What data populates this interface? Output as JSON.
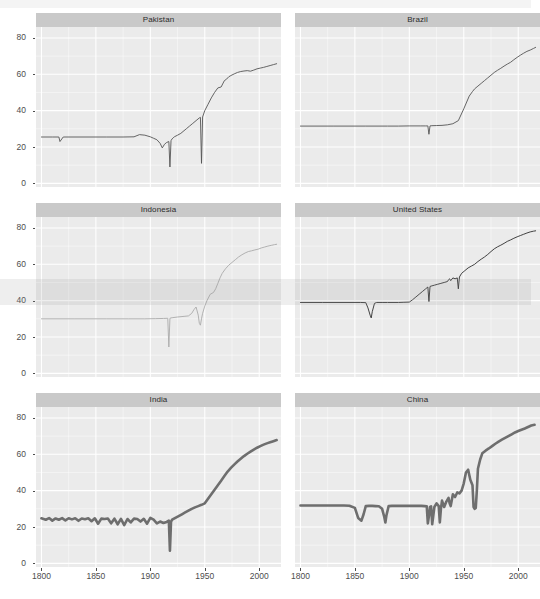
{
  "figure": {
    "kind": "small-multiples-line-chart",
    "background": "#ffffff",
    "panel_background": "#ebebeb",
    "gridline_color": "#ffffff",
    "strip_background": "#c9c9c9",
    "axis_text_color": "#4d4d4d"
  },
  "axes": {
    "y_ticks": [
      "0",
      "20",
      "40",
      "60",
      "80"
    ],
    "y_values": [
      0,
      20,
      40,
      60,
      80
    ],
    "x_ticks": [
      "1800",
      "1850",
      "1900",
      "1950",
      "2000"
    ],
    "x_values": [
      1800,
      1850,
      1900,
      1950,
      2000
    ],
    "xlim": [
      1795,
      2020
    ],
    "ylim": [
      -2,
      86
    ],
    "xlabel": "",
    "ylabel": "",
    "grid": true
  },
  "chart_data": {
    "type": "line",
    "title": "",
    "subtitle": "",
    "xlabel": "",
    "ylabel": "",
    "xlim": [
      1795,
      2020
    ],
    "ylim": [
      -2,
      86
    ],
    "grid": true,
    "legend": "none",
    "facet_layout": {
      "rows": 3,
      "cols": 2
    },
    "panels": [
      {
        "label": "Pakistan",
        "row": 0,
        "col": 0,
        "color": "#555555",
        "line_width": 0.9,
        "x": [
          1800,
          1810,
          1816,
          1817,
          1820,
          1840,
          1860,
          1875,
          1885,
          1890,
          1895,
          1900,
          1903,
          1906,
          1909,
          1911,
          1913,
          1915,
          1917,
          1918,
          1919,
          1920,
          1921,
          1922,
          1925,
          1928,
          1930,
          1933,
          1936,
          1939,
          1942,
          1945,
          1946,
          1947,
          1948,
          1950,
          1953,
          1956,
          1959,
          1962,
          1965,
          1968,
          1970,
          1971,
          1972,
          1974,
          1977,
          1980,
          1983,
          1986,
          1989,
          1992,
          1995,
          1998,
          2001,
          2004,
          2007,
          2010,
          2013,
          2016
        ],
        "y": [
          25.5,
          25.5,
          25.5,
          23.0,
          25.5,
          25.5,
          25.5,
          25.5,
          25.6,
          26.8,
          26.5,
          25.6,
          24.8,
          24.0,
          22.0,
          19.5,
          21.5,
          22.5,
          23.0,
          9.0,
          23.5,
          24.5,
          25.0,
          25.6,
          26.5,
          27.5,
          28.5,
          30.0,
          31.5,
          33.0,
          34.5,
          36.0,
          36.3,
          11.0,
          36.5,
          40.0,
          43.5,
          47.0,
          50.0,
          52.5,
          53.0,
          56.5,
          57.3,
          58.0,
          58.6,
          59.3,
          60.2,
          61.0,
          61.5,
          61.8,
          62.0,
          61.7,
          62.3,
          63.0,
          63.4,
          63.8,
          64.3,
          64.8,
          65.3,
          65.8
        ]
      },
      {
        "label": "Brazil",
        "row": 0,
        "col": 1,
        "color": "#555555",
        "line_width": 0.9,
        "x": [
          1800,
          1830,
          1860,
          1880,
          1890,
          1900,
          1910,
          1915,
          1917,
          1918,
          1919,
          1920,
          1925,
          1930,
          1935,
          1940,
          1945,
          1950,
          1955,
          1958,
          1960,
          1963,
          1966,
          1969,
          1972,
          1975,
          1978,
          1981,
          1984,
          1987,
          1990,
          1993,
          1996,
          1999,
          2002,
          2005,
          2008,
          2011,
          2014,
          2016
        ],
        "y": [
          31.5,
          31.5,
          31.5,
          31.5,
          31.5,
          31.6,
          31.6,
          31.6,
          31.6,
          27.0,
          31.6,
          31.7,
          31.8,
          31.9,
          32.2,
          32.8,
          34.5,
          41.0,
          48.0,
          50.5,
          52.0,
          53.5,
          55.0,
          56.5,
          58.0,
          59.5,
          61.0,
          62.2,
          63.3,
          64.5,
          65.6,
          66.6,
          68.0,
          69.3,
          70.5,
          71.6,
          72.6,
          73.3,
          74.2,
          74.8
        ]
      },
      {
        "label": "Indonesia",
        "row": 1,
        "col": 0,
        "color": "#aaaaaa",
        "line_width": 0.9,
        "x": [
          1800,
          1830,
          1860,
          1880,
          1895,
          1905,
          1912,
          1916,
          1917,
          1918,
          1919,
          1920,
          1925,
          1930,
          1935,
          1938,
          1940,
          1942,
          1944,
          1945,
          1946,
          1947,
          1948,
          1950,
          1952,
          1955,
          1958,
          1960,
          1962,
          1964,
          1966,
          1969,
          1972,
          1975,
          1978,
          1981,
          1984,
          1987,
          1990,
          1993,
          1996,
          1999,
          2002,
          2005,
          2008,
          2011,
          2014,
          2016
        ],
        "y": [
          30.0,
          30.0,
          30.0,
          30.0,
          30.0,
          30.1,
          30.2,
          30.3,
          14.5,
          30.3,
          30.5,
          30.6,
          31.0,
          31.3,
          31.6,
          33.0,
          35.0,
          36.5,
          32.0,
          27.5,
          26.5,
          30.0,
          33.0,
          37.0,
          40.0,
          43.5,
          44.5,
          46.5,
          49.5,
          52.5,
          55.0,
          57.5,
          59.5,
          61.0,
          62.5,
          64.0,
          65.2,
          66.2,
          67.0,
          67.4,
          67.9,
          68.3,
          69.0,
          69.5,
          70.0,
          70.4,
          70.8,
          71.0
        ]
      },
      {
        "label": "United States",
        "row": 1,
        "col": 1,
        "color": "#2e2e2e",
        "line_width": 0.9,
        "x": [
          1800,
          1820,
          1840,
          1855,
          1860,
          1862,
          1864,
          1865,
          1866,
          1868,
          1870,
          1875,
          1880,
          1885,
          1890,
          1895,
          1900,
          1903,
          1906,
          1909,
          1912,
          1915,
          1917,
          1918,
          1919,
          1920,
          1923,
          1926,
          1929,
          1932,
          1935,
          1936,
          1937,
          1938,
          1940,
          1942,
          1944,
          1945,
          1946,
          1948,
          1951,
          1954,
          1957,
          1960,
          1963,
          1966,
          1969,
          1972,
          1975,
          1978,
          1981,
          1984,
          1987,
          1990,
          1993,
          1996,
          1999,
          2002,
          2005,
          2008,
          2011,
          2014,
          2016
        ],
        "y": [
          39.0,
          39.0,
          39.0,
          39.0,
          38.9,
          36.0,
          32.0,
          30.5,
          34.0,
          38.5,
          39.0,
          39.0,
          39.0,
          39.0,
          39.0,
          39.1,
          39.2,
          40.5,
          42.0,
          43.5,
          45.0,
          46.5,
          47.5,
          39.5,
          47.8,
          48.0,
          48.5,
          49.0,
          49.5,
          50.0,
          50.5,
          51.5,
          52.0,
          51.0,
          52.5,
          52.0,
          52.5,
          46.5,
          53.0,
          55.0,
          56.5,
          58.0,
          59.0,
          60.0,
          61.5,
          62.8,
          64.0,
          65.4,
          67.0,
          68.5,
          69.6,
          70.5,
          71.5,
          72.6,
          73.4,
          74.3,
          75.1,
          75.8,
          76.5,
          77.2,
          77.8,
          78.2,
          78.4
        ]
      },
      {
        "label": "India",
        "row": 2,
        "col": 0,
        "color": "#6e6e6e",
        "line_width": 2.6,
        "x": [
          1800,
          1804,
          1807,
          1810,
          1813,
          1816,
          1819,
          1822,
          1825,
          1828,
          1831,
          1834,
          1837,
          1840,
          1843,
          1846,
          1849,
          1852,
          1855,
          1858,
          1861,
          1864,
          1867,
          1870,
          1873,
          1876,
          1879,
          1882,
          1885,
          1888,
          1891,
          1894,
          1897,
          1900,
          1903,
          1906,
          1909,
          1912,
          1915,
          1917,
          1918,
          1919,
          1920,
          1923,
          1926,
          1929,
          1932,
          1935,
          1938,
          1941,
          1944,
          1947,
          1950,
          1953,
          1956,
          1959,
          1962,
          1965,
          1968,
          1971,
          1974,
          1977,
          1980,
          1983,
          1986,
          1989,
          1992,
          1995,
          1998,
          2001,
          2004,
          2007,
          2010,
          2013,
          2016
        ],
        "y": [
          24.8,
          24.0,
          24.9,
          23.5,
          24.7,
          24.0,
          24.9,
          23.6,
          24.8,
          24.2,
          24.8,
          23.4,
          24.7,
          24.3,
          24.8,
          23.2,
          24.8,
          21.8,
          24.6,
          24.4,
          24.7,
          22.0,
          24.6,
          21.5,
          24.5,
          21.0,
          24.4,
          22.5,
          24.6,
          24.4,
          23.0,
          24.5,
          21.8,
          25.0,
          24.0,
          22.0,
          23.0,
          22.2,
          22.8,
          23.5,
          7.0,
          23.0,
          24.0,
          25.0,
          26.0,
          27.0,
          28.0,
          29.0,
          30.0,
          30.8,
          31.5,
          32.2,
          33.0,
          35.5,
          38.0,
          40.5,
          43.0,
          45.5,
          48.0,
          50.5,
          52.5,
          54.3,
          56.0,
          57.5,
          59.0,
          60.3,
          61.5,
          62.6,
          63.6,
          64.5,
          65.3,
          66.0,
          66.6,
          67.2,
          67.8
        ]
      },
      {
        "label": "China",
        "row": 2,
        "col": 1,
        "color": "#6e6e6e",
        "line_width": 2.6,
        "x": [
          1800,
          1810,
          1820,
          1830,
          1840,
          1845,
          1850,
          1853,
          1856,
          1858,
          1860,
          1863,
          1866,
          1869,
          1872,
          1875,
          1877,
          1878,
          1879,
          1881,
          1884,
          1887,
          1890,
          1893,
          1896,
          1899,
          1902,
          1905,
          1908,
          1911,
          1914,
          1916,
          1917,
          1918,
          1919,
          1920,
          1921,
          1923,
          1925,
          1927,
          1928,
          1929,
          1930,
          1932,
          1934,
          1936,
          1937,
          1938,
          1940,
          1942,
          1944,
          1946,
          1948,
          1950,
          1952,
          1954,
          1956,
          1958,
          1959,
          1960,
          1961,
          1962,
          1963,
          1965,
          1967,
          1970,
          1973,
          1976,
          1979,
          1982,
          1985,
          1988,
          1991,
          1994,
          1997,
          2000,
          2003,
          2006,
          2009,
          2012,
          2015
        ],
        "y": [
          31.8,
          31.8,
          31.8,
          31.8,
          31.8,
          31.7,
          30.5,
          25.0,
          23.5,
          27.0,
          31.5,
          31.6,
          31.6,
          31.5,
          31.4,
          30.0,
          25.5,
          22.5,
          26.5,
          31.5,
          31.6,
          31.6,
          31.6,
          31.6,
          31.6,
          31.6,
          31.6,
          31.6,
          31.6,
          31.6,
          31.5,
          31.4,
          22.0,
          26.0,
          31.0,
          31.3,
          21.5,
          31.0,
          33.0,
          31.5,
          22.5,
          30.0,
          34.5,
          31.0,
          34.0,
          36.0,
          33.0,
          31.5,
          38.0,
          36.5,
          39.0,
          38.5,
          40.0,
          44.0,
          50.0,
          51.5,
          46.0,
          43.0,
          31.0,
          30.0,
          30.5,
          40.0,
          52.0,
          57.0,
          60.5,
          62.0,
          63.2,
          64.5,
          65.8,
          67.0,
          68.0,
          69.0,
          70.0,
          71.0,
          72.0,
          72.8,
          73.5,
          74.2,
          75.0,
          75.8,
          76.2
        ]
      }
    ]
  }
}
